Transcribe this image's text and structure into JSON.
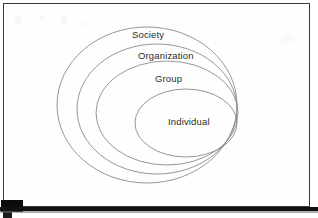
{
  "figure": {
    "type": "nested-ellipse-diagram",
    "background_color": "#ffffff",
    "frame_color": "#3a3a3a",
    "ellipse_stroke_color": "#8b8b8b",
    "text_color": "#2b2b2b",
    "bottom_bar_color": "#111111",
    "corner_marker_color": "#0b0b0b"
  },
  "diagram": {
    "levels": [
      {
        "label": "Society",
        "order": 1,
        "scope": "outermost",
        "ellipse": {
          "cx": 147,
          "cy": 105,
          "rx": 90,
          "ry": 78
        }
      },
      {
        "label": "Organization",
        "order": 2,
        "scope": "second",
        "ellipse": {
          "cx": 157,
          "cy": 109,
          "rx": 80,
          "ry": 65
        }
      },
      {
        "label": "Group",
        "order": 3,
        "scope": "third",
        "ellipse": {
          "cx": 167,
          "cy": 113,
          "rx": 71,
          "ry": 52
        }
      },
      {
        "label": "Individual",
        "order": 4,
        "scope": "innermost",
        "ellipse": {
          "cx": 186,
          "cy": 123,
          "rx": 51,
          "ry": 34
        }
      }
    ]
  }
}
